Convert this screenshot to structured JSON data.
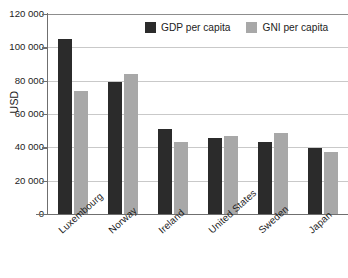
{
  "chart_data": {
    "type": "bar",
    "title": "",
    "subtitle": "",
    "xlabel": "",
    "ylabel": "USD",
    "ylim": [
      0,
      120000
    ],
    "grid": true,
    "legend_position": "top-center",
    "categories": [
      "Luxembourg",
      "Norway",
      "Ireland",
      "United States",
      "Sweden",
      "Japan"
    ],
    "series": [
      {
        "name": "GDP per capita",
        "color": "#2b2b2b",
        "values": [
          105000,
          79000,
          51000,
          45500,
          43500,
          39500
        ]
      },
      {
        "name": "GNI per capita",
        "color": "#a8a8a8",
        "values": [
          74000,
          84000,
          43500,
          47000,
          48500,
          37000
        ]
      }
    ],
    "y_ticks": [
      0,
      20000,
      40000,
      60000,
      80000,
      100000,
      120000
    ],
    "y_tick_labels": [
      "0",
      "20 000",
      "40 000",
      "60 000",
      "80 000",
      "100 000",
      "120 000"
    ]
  },
  "legend": {
    "entries": [
      {
        "label": "GDP per capita"
      },
      {
        "label": "GNI per capita"
      }
    ]
  },
  "colors": {
    "gdp": "#2b2b2b",
    "gni": "#a8a8a8",
    "gridline": "#c9c9c9",
    "axis": "#6f6f6f",
    "text": "#1d1d1d",
    "background": "#ffffff"
  }
}
